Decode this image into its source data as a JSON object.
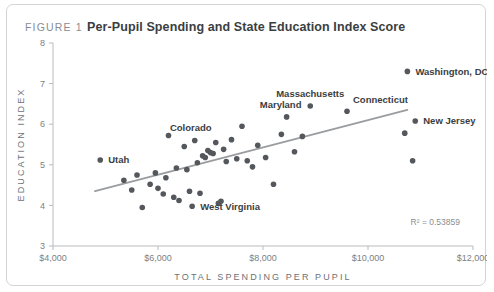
{
  "figure": {
    "tag": "FIGURE 1",
    "title": "Per-Pupil Spending and State Education Index Score"
  },
  "chart_data": {
    "type": "scatter",
    "title": "Per-Pupil Spending and State Education Index Score",
    "xlabel": "TOTAL SPENDING PER PUPIL",
    "ylabel": "EDUCATION INDEX",
    "xlim": [
      4000,
      12000
    ],
    "ylim": [
      3,
      8
    ],
    "xticks": [
      4000,
      6000,
      8000,
      10000,
      12000
    ],
    "xticklabels": [
      "$4,000",
      "$6,000",
      "$8,000",
      "$10,000",
      "$12,000"
    ],
    "yticks": [
      3,
      4,
      5,
      6,
      7,
      8
    ],
    "yticklabels": [
      "3",
      "4",
      "5",
      "6",
      "7",
      "8"
    ],
    "grid": false,
    "legend": null,
    "annotation": "R² = 0.53859",
    "r_squared": 0.53859,
    "trendline": {
      "x": [
        4800,
        10750
      ],
      "y": [
        4.35,
        6.35
      ]
    },
    "points": [
      {
        "x": 4900,
        "y": 5.12,
        "label": "Utah"
      },
      {
        "x": 5350,
        "y": 4.62,
        "label": null
      },
      {
        "x": 5500,
        "y": 4.38,
        "label": null
      },
      {
        "x": 5600,
        "y": 4.75,
        "label": null
      },
      {
        "x": 5700,
        "y": 3.95,
        "label": null
      },
      {
        "x": 5850,
        "y": 4.52,
        "label": null
      },
      {
        "x": 5950,
        "y": 4.8,
        "label": null
      },
      {
        "x": 6000,
        "y": 4.42,
        "label": null
      },
      {
        "x": 6100,
        "y": 4.28,
        "label": null
      },
      {
        "x": 6150,
        "y": 4.68,
        "label": null
      },
      {
        "x": 6200,
        "y": 5.72,
        "label": null
      },
      {
        "x": 6300,
        "y": 4.2,
        "label": null
      },
      {
        "x": 6350,
        "y": 4.92,
        "label": null
      },
      {
        "x": 6400,
        "y": 4.12,
        "label": null
      },
      {
        "x": 6500,
        "y": 5.45,
        "label": null
      },
      {
        "x": 6550,
        "y": 4.88,
        "label": null
      },
      {
        "x": 6600,
        "y": 4.35,
        "label": null
      },
      {
        "x": 6650,
        "y": 3.98,
        "label": "West Virginia"
      },
      {
        "x": 6700,
        "y": 5.6,
        "label": "Colorado"
      },
      {
        "x": 6750,
        "y": 5.05,
        "label": null
      },
      {
        "x": 6800,
        "y": 4.3,
        "label": null
      },
      {
        "x": 6850,
        "y": 5.22,
        "label": null
      },
      {
        "x": 6900,
        "y": 5.18,
        "label": null
      },
      {
        "x": 6950,
        "y": 5.35,
        "label": null
      },
      {
        "x": 7000,
        "y": 5.3,
        "label": null
      },
      {
        "x": 7050,
        "y": 5.28,
        "label": null
      },
      {
        "x": 7100,
        "y": 5.55,
        "label": null
      },
      {
        "x": 7150,
        "y": 4.05,
        "label": null
      },
      {
        "x": 7200,
        "y": 4.1,
        "label": null
      },
      {
        "x": 7250,
        "y": 5.38,
        "label": null
      },
      {
        "x": 7300,
        "y": 5.08,
        "label": null
      },
      {
        "x": 7400,
        "y": 5.62,
        "label": null
      },
      {
        "x": 7500,
        "y": 5.15,
        "label": null
      },
      {
        "x": 7600,
        "y": 5.95,
        "label": null
      },
      {
        "x": 7700,
        "y": 5.1,
        "label": null
      },
      {
        "x": 7800,
        "y": 4.95,
        "label": null
      },
      {
        "x": 7900,
        "y": 5.48,
        "label": null
      },
      {
        "x": 8050,
        "y": 5.18,
        "label": null
      },
      {
        "x": 8200,
        "y": 4.52,
        "label": null
      },
      {
        "x": 8350,
        "y": 5.75,
        "label": null
      },
      {
        "x": 8450,
        "y": 6.18,
        "label": "Maryland"
      },
      {
        "x": 8600,
        "y": 5.32,
        "label": null
      },
      {
        "x": 8750,
        "y": 5.7,
        "label": null
      },
      {
        "x": 8900,
        "y": 6.45,
        "label": "Massachusetts"
      },
      {
        "x": 9600,
        "y": 6.32,
        "label": "Connecticut"
      },
      {
        "x": 10750,
        "y": 7.3,
        "label": "Washington, DC"
      },
      {
        "x": 10900,
        "y": 6.08,
        "label": "New Jersey"
      },
      {
        "x": 10850,
        "y": 5.1,
        "label": null
      },
      {
        "x": 10700,
        "y": 5.78,
        "label": null
      }
    ]
  }
}
